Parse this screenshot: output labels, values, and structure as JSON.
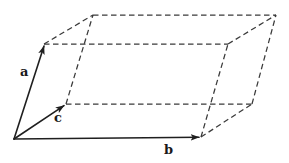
{
  "figure": {
    "name": "crystal-unit-cell-parallelepiped",
    "background_color": "#ffffff",
    "line_color": "#2b2b2b",
    "dashed_color": "#3a3a3a",
    "labels": {
      "a": "a",
      "b": "b",
      "c": "c"
    },
    "geometry": {
      "origin": [
        14,
        139
      ],
      "a_tip": [
        44,
        44
      ],
      "b_tip": [
        201,
        137
      ],
      "c_tip": [
        66,
        104
      ],
      "ac": [
        93,
        15
      ],
      "ab": [
        228,
        44
      ],
      "bc": [
        252,
        104
      ],
      "abc": [
        276,
        15
      ]
    },
    "vectors": [
      {
        "name": "a",
        "style": "solid-arrow",
        "from": [
          14,
          139
        ],
        "to": [
          44,
          44
        ]
      },
      {
        "name": "b",
        "style": "solid-arrow",
        "from": [
          14,
          139
        ],
        "to": [
          201,
          137
        ]
      },
      {
        "name": "c",
        "style": "solid-arrow",
        "from": [
          14,
          139
        ],
        "to": [
          66,
          104
        ]
      }
    ],
    "dashed_edges": [
      {
        "from": [
          44,
          44
        ],
        "to": [
          93,
          15
        ]
      },
      {
        "from": [
          66,
          104
        ],
        "to": [
          93,
          15
        ]
      },
      {
        "from": [
          44,
          44
        ],
        "to": [
          228,
          44
        ]
      },
      {
        "from": [
          93,
          15
        ],
        "to": [
          276,
          15
        ]
      },
      {
        "from": [
          66,
          104
        ],
        "to": [
          252,
          104
        ]
      },
      {
        "from": [
          201,
          137
        ],
        "to": [
          228,
          44
        ]
      },
      {
        "from": [
          228,
          44
        ],
        "to": [
          276,
          15
        ]
      },
      {
        "from": [
          252,
          104
        ],
        "to": [
          276,
          15
        ]
      },
      {
        "from": [
          201,
          137
        ],
        "to": [
          252,
          104
        ]
      }
    ]
  }
}
